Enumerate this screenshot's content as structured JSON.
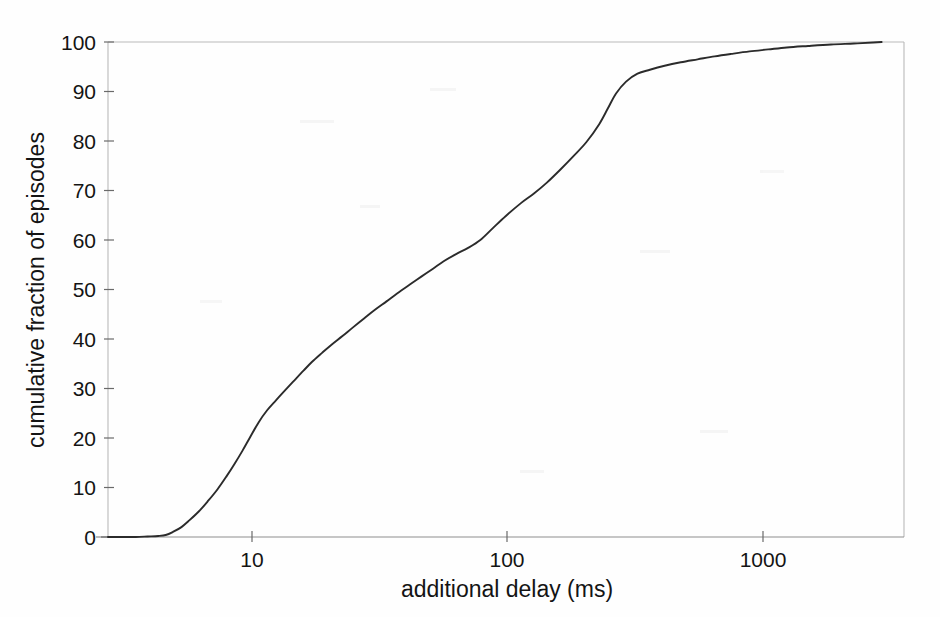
{
  "figure": {
    "background_color": "#fefefe",
    "curve_color": "#2b2b2b",
    "axis_color": "#8e8e8e",
    "text_color": "#141414"
  },
  "axes": {
    "x": {
      "title": "additional delay (ms)",
      "scale": "log",
      "tick_labels": [
        "10",
        "100",
        "1000"
      ],
      "tick_values": [
        10,
        100,
        1000
      ],
      "range_min": 3.0,
      "range_max": 2600
    },
    "y": {
      "title": "cumulative fraction of episodes",
      "scale": "linear",
      "tick_labels": [
        "0",
        "10",
        "20",
        "30",
        "40",
        "50",
        "60",
        "70",
        "80",
        "90",
        "100"
      ],
      "tick_values": [
        0,
        10,
        20,
        30,
        40,
        50,
        60,
        70,
        80,
        90,
        100
      ],
      "range_min": 0,
      "range_max": 100
    }
  },
  "chart_data": {
    "type": "line",
    "title": "",
    "subtitle": "",
    "xlabel": "additional delay (ms)",
    "ylabel": "cumulative fraction of episodes",
    "xscale": "log",
    "yscale": "linear",
    "xlim": [
      3.0,
      2600
    ],
    "ylim": [
      0,
      100
    ],
    "xticks": [
      10,
      100,
      1000
    ],
    "xticklabels": [
      "10",
      "100",
      "1000"
    ],
    "yticks": [
      0,
      10,
      20,
      30,
      40,
      50,
      60,
      70,
      80,
      90,
      100
    ],
    "yticklabels": [
      "0",
      "10",
      "20",
      "30",
      "40",
      "50",
      "60",
      "70",
      "80",
      "90",
      "100"
    ],
    "grid": false,
    "legend": null,
    "annotations": [],
    "series": [
      {
        "name": "cumulative distribution of additional delay",
        "x": [
          3.0,
          3.4,
          3.8,
          4.2,
          4.6,
          4.9,
          5.2,
          5.6,
          6.0,
          6.5,
          7.0,
          7.6,
          8.2,
          8.8,
          9.4,
          10.0,
          10.8,
          11.6,
          12.5,
          13.5,
          14.6,
          15.8,
          17.0,
          18.5,
          20.0,
          22.0,
          24.0,
          26.5,
          29.0,
          32.0,
          35.0,
          39.0,
          43.0,
          47.5,
          52.0,
          58.0,
          64.0,
          71.0,
          79.0,
          88.0,
          100.0,
          112.0,
          125.0,
          140.0,
          157.0,
          175.0,
          195.0,
          210.0,
          225.0,
          245.0,
          270.0,
          300.0,
          340.0,
          390.0,
          450.0,
          520.0,
          600.0,
          700.0,
          820.0,
          960.0,
          1150.0,
          1400.0,
          1700.0,
          2000.0,
          2150.0
        ],
        "y": [
          0.0,
          0.0,
          0.0,
          0.1,
          0.2,
          0.4,
          1.0,
          2.0,
          3.4,
          5.2,
          7.2,
          9.6,
          12.2,
          14.8,
          17.4,
          20.0,
          23.2,
          25.6,
          27.6,
          29.6,
          31.6,
          33.6,
          35.4,
          37.2,
          38.8,
          40.6,
          42.3,
          44.2,
          45.9,
          47.6,
          49.2,
          51.0,
          52.6,
          54.2,
          55.7,
          57.2,
          58.4,
          60.0,
          62.4,
          64.8,
          67.4,
          69.4,
          71.6,
          74.2,
          77.0,
          79.8,
          83.4,
          86.6,
          89.6,
          92.0,
          93.6,
          94.4,
          95.2,
          95.9,
          96.5,
          97.1,
          97.6,
          98.1,
          98.5,
          98.9,
          99.2,
          99.5,
          99.7,
          99.9,
          100.0
        ]
      }
    ]
  }
}
